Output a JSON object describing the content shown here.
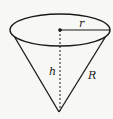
{
  "diagram": {
    "labels": {
      "radius": "r",
      "height": "h",
      "slant": "R"
    },
    "colors": {
      "stroke": "#1a1a1a",
      "background": "#f7f7f5"
    },
    "geometry": {
      "base_center": [
        60,
        30
      ],
      "base_rx": 50,
      "base_ry": 16,
      "apex": [
        59,
        112
      ]
    }
  }
}
